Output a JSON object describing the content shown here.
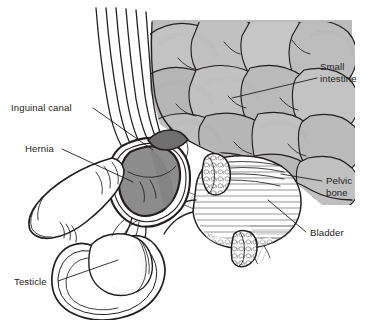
{
  "figure": {
    "kind": "anatomical-illustration",
    "title_visible": false,
    "background_color": "#ffffff",
    "ink_color": "#231f20",
    "palette": {
      "intestine_fill": "#bcbcbc",
      "intestine_shadow": "#a9a9a9",
      "hernia_fill": "#8c8c8c",
      "hernia_fill_dark": "#7e7e7e",
      "organ_white": "#ffffff",
      "label_color": "#231f20"
    },
    "labels": [
      {
        "id": "small-intestine",
        "name": "small-intestine-label",
        "lines": [
          "Small",
          "intestine"
        ],
        "text_x": 320,
        "text_y": 70,
        "leader": "M 317 78 L 232 98"
      },
      {
        "id": "inguinal-canal",
        "name": "inguinal-canal-label",
        "lines": [
          "Inguinal canal"
        ],
        "text_x": 11,
        "text_y": 111,
        "leader": "M 93 108 L 153 150"
      },
      {
        "id": "hernia",
        "name": "hernia-label",
        "lines": [
          "Hernia"
        ],
        "text_x": 25,
        "text_y": 152,
        "leader": "M 62 149 L 133 182"
      },
      {
        "id": "pelvic-bone",
        "name": "pelvic-bone-label",
        "lines": [
          "Pelvic",
          "bone"
        ],
        "text_x": 326,
        "text_y": 184,
        "leader": "M 322 181 L 281 174"
      },
      {
        "id": "bladder",
        "name": "bladder-label",
        "lines": [
          "Bladder"
        ],
        "text_x": 310,
        "text_y": 236,
        "leader": "M 306 232 L 268 200"
      },
      {
        "id": "testicle",
        "name": "testicle-label",
        "lines": [
          "Testicle"
        ],
        "text_x": 14,
        "text_y": 285,
        "leader": "M 58 281 L 118 260"
      }
    ],
    "structures": [
      {
        "name": "abdominal-wall-layers",
        "description": "stack of parallel curved lines sweeping from top down to the inguinal region"
      },
      {
        "name": "small-intestine-mass",
        "description": "cluster of gray overlapping bowel loops filling upper right"
      },
      {
        "name": "hernia-sac",
        "description": "dark gray teardrop bulge of bowel pushing through the inguinal canal"
      },
      {
        "name": "inguinal-canal",
        "description": "white double-walled channel running from abdomen into scrotum"
      },
      {
        "name": "penis-shaft",
        "description": "tubular structure extending to the lower left"
      },
      {
        "name": "scrotum",
        "description": "double-lined sac enclosing the testicle"
      },
      {
        "name": "testicle",
        "description": "oval organ inside the scrotum"
      },
      {
        "name": "bladder",
        "description": "large white hatched rounded organ at right"
      },
      {
        "name": "pelvic-bone-upper",
        "description": "cut oval bone cross-section with trabecular pattern above bladder"
      },
      {
        "name": "pelvic-bone-lower",
        "description": "cut oval bone cross-section with trabecular pattern below bladder"
      }
    ]
  }
}
